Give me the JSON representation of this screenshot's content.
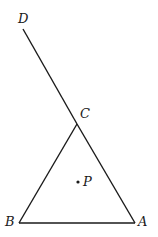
{
  "diagram": {
    "points": {
      "D": {
        "label": "D",
        "x": 23,
        "y": 29
      },
      "C": {
        "label": "C",
        "x": 77,
        "y": 124
      },
      "B": {
        "label": "B",
        "x": 19,
        "y": 223
      },
      "A": {
        "label": "A",
        "x": 135,
        "y": 223
      },
      "P": {
        "label": "P",
        "x": 78,
        "y": 182
      }
    },
    "segments": [
      [
        "D",
        "C"
      ],
      [
        "C",
        "B"
      ],
      [
        "B",
        "A"
      ],
      [
        "A",
        "C"
      ]
    ],
    "stroke_color": "#1a1a1a"
  }
}
